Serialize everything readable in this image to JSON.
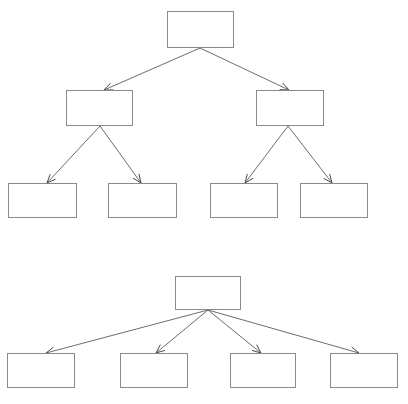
{
  "canvas": {
    "width": 408,
    "height": 404,
    "background": "#ffffff",
    "box_border_color": "#8a8a8a",
    "box_fill_color": "#ffffff",
    "edge_color": "#6d6d6d",
    "arrowhead_color": "#4a4a4a"
  },
  "diagrams": [
    {
      "id": "top-diagram",
      "type": "tree",
      "levels": 3,
      "nodes": [
        {
          "id": "t-root",
          "label": "",
          "x": 167,
          "y": 11,
          "w": 67,
          "h": 37,
          "level": 1
        },
        {
          "id": "t-l2-a",
          "label": "",
          "x": 66,
          "y": 90,
          "w": 67,
          "h": 36,
          "level": 2
        },
        {
          "id": "t-l2-b",
          "label": "",
          "x": 256,
          "y": 90,
          "w": 68,
          "h": 36,
          "level": 2
        },
        {
          "id": "t-l3-a",
          "label": "",
          "x": 8,
          "y": 183,
          "w": 69,
          "h": 35,
          "level": 3
        },
        {
          "id": "t-l3-b",
          "label": "",
          "x": 108,
          "y": 183,
          "w": 69,
          "h": 35,
          "level": 3
        },
        {
          "id": "t-l3-c",
          "label": "",
          "x": 210,
          "y": 183,
          "w": 68,
          "h": 35,
          "level": 3
        },
        {
          "id": "t-l3-d",
          "label": "",
          "x": 300,
          "y": 183,
          "w": 68,
          "h": 35,
          "level": 3
        }
      ],
      "edges": [
        {
          "from": "t-root",
          "to": "t-l2-a",
          "x1": 200,
          "y1": 48,
          "x2": 104,
          "y2": 90
        },
        {
          "from": "t-root",
          "to": "t-l2-b",
          "x1": 200,
          "y1": 48,
          "x2": 289,
          "y2": 90
        },
        {
          "from": "t-l2-a",
          "to": "t-l3-a",
          "x1": 100,
          "y1": 126,
          "x2": 47,
          "y2": 183
        },
        {
          "from": "t-l2-a",
          "to": "t-l3-b",
          "x1": 100,
          "y1": 126,
          "x2": 141,
          "y2": 183
        },
        {
          "from": "t-l2-b",
          "to": "t-l3-c",
          "x1": 288,
          "y1": 126,
          "x2": 245,
          "y2": 183
        },
        {
          "from": "t-l2-b",
          "to": "t-l3-d",
          "x1": 288,
          "y1": 126,
          "x2": 332,
          "y2": 183
        }
      ]
    },
    {
      "id": "bottom-diagram",
      "type": "tree",
      "levels": 2,
      "nodes": [
        {
          "id": "b-root",
          "label": "",
          "x": 175,
          "y": 276,
          "w": 66,
          "h": 34,
          "level": 1
        },
        {
          "id": "b-l2-a",
          "label": "",
          "x": 7,
          "y": 353,
          "w": 68,
          "h": 35,
          "level": 2
        },
        {
          "id": "b-l2-b",
          "label": "",
          "x": 120,
          "y": 353,
          "w": 68,
          "h": 35,
          "level": 2
        },
        {
          "id": "b-l2-c",
          "label": "",
          "x": 230,
          "y": 353,
          "w": 66,
          "h": 35,
          "level": 2
        },
        {
          "id": "b-l2-d",
          "label": "",
          "x": 330,
          "y": 353,
          "w": 68,
          "h": 35,
          "level": 2
        }
      ],
      "edges": [
        {
          "from": "b-root",
          "to": "b-l2-a",
          "x1": 208,
          "y1": 310,
          "x2": 46,
          "y2": 353
        },
        {
          "from": "b-root",
          "to": "b-l2-b",
          "x1": 208,
          "y1": 310,
          "x2": 156,
          "y2": 353
        },
        {
          "from": "b-root",
          "to": "b-l2-c",
          "x1": 208,
          "y1": 310,
          "x2": 261,
          "y2": 353
        },
        {
          "from": "b-root",
          "to": "b-l2-d",
          "x1": 208,
          "y1": 310,
          "x2": 359,
          "y2": 353
        }
      ]
    }
  ]
}
